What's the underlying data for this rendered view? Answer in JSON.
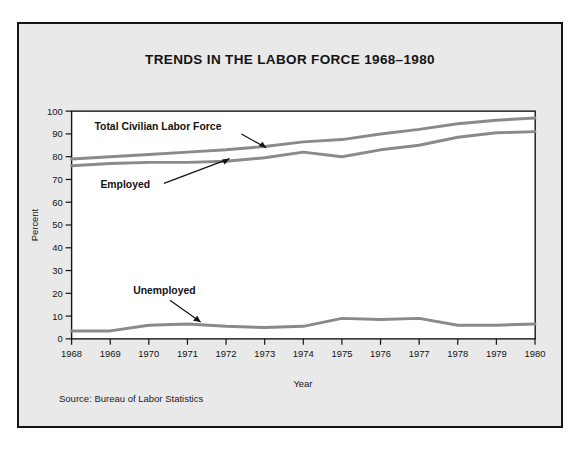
{
  "figure": {
    "title": "TRENDS IN THE LABOR FORCE 1968–1980",
    "source_note": "Source: Bureau of Labor Statistics",
    "background_color": "#e9e9e9",
    "plot_background_color": "#ffffff",
    "frame_color": "#151515",
    "line_color": "#8a8a8a",
    "text_color": "#131313"
  },
  "chart_data": {
    "type": "line",
    "title": "TRENDS IN THE LABOR FORCE 1968–1980",
    "xlabel": "Year",
    "ylabel": "Percent",
    "xlim": [
      1968,
      1980
    ],
    "ylim": [
      0,
      100
    ],
    "grid": false,
    "legend_position": "inline-annotations",
    "x": [
      1968,
      1969,
      1970,
      1971,
      1972,
      1973,
      1974,
      1975,
      1976,
      1977,
      1978,
      1979,
      1980
    ],
    "xtick_labels": [
      "1968",
      "1969",
      "1970",
      "1971",
      "1972",
      "1973",
      "1974",
      "1975",
      "1976",
      "1977",
      "1978",
      "1979",
      "1980"
    ],
    "ytick_labels": [
      "0",
      "10",
      "20",
      "30",
      "40",
      "50",
      "60",
      "70",
      "80",
      "90",
      "100"
    ],
    "yticks": [
      0,
      10,
      20,
      30,
      40,
      50,
      60,
      70,
      80,
      90,
      100
    ],
    "series": [
      {
        "name": "Total Civilian Labor Force",
        "values": [
          79,
          80,
          81,
          82,
          83,
          84.5,
          86.5,
          87.5,
          90,
          92,
          94.5,
          96,
          97
        ]
      },
      {
        "name": "Employed",
        "values": [
          76,
          77,
          77.5,
          77.5,
          78,
          79.5,
          82,
          80,
          83,
          85,
          88.5,
          90.5,
          91
        ]
      },
      {
        "name": "Unemployed",
        "values": [
          3.5,
          3.5,
          6,
          6.5,
          5.5,
          5,
          5.5,
          9,
          8.5,
          9,
          6,
          6,
          6.5
        ]
      }
    ],
    "annotations": [
      {
        "label": "Total Civilian Labor Force",
        "points_to_year": 1974,
        "points_to_value": 86.5
      },
      {
        "label": "Employed",
        "points_to_year": 1973,
        "points_to_value": 79.5
      },
      {
        "label": "Unemployed",
        "points_to_year": 1971.4,
        "points_to_value": 6.4
      }
    ]
  }
}
